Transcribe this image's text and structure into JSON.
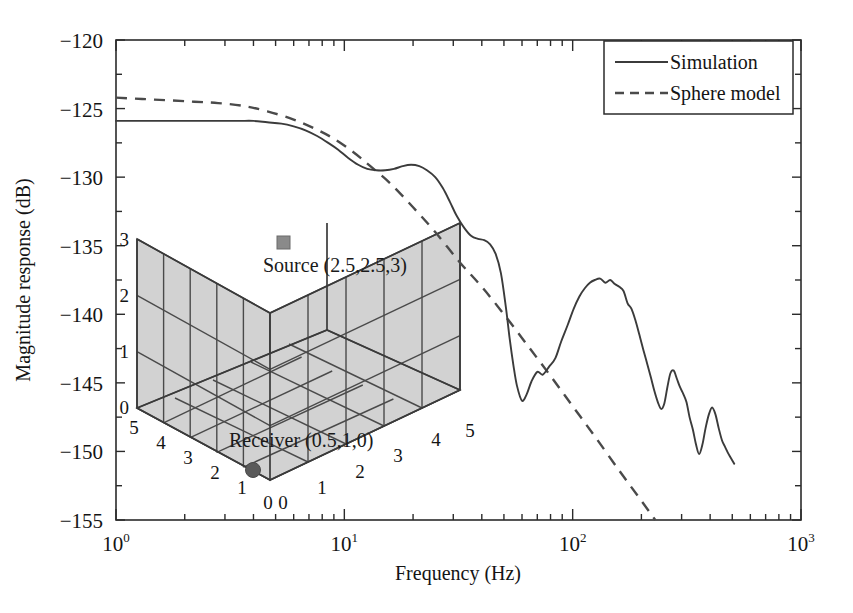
{
  "chart_data": {
    "type": "line",
    "title": "",
    "xlabel": "Frequency (Hz)",
    "ylabel": "Magnitude response (dB)",
    "xscale": "log",
    "xlim": [
      1,
      1000
    ],
    "ylim": [
      -155,
      -120
    ],
    "grid": false,
    "legend_position": "top-right",
    "xticks": [
      {
        "value": 1,
        "mantissa": "10",
        "exponent": "0"
      },
      {
        "value": 10,
        "mantissa": "10",
        "exponent": "1"
      },
      {
        "value": 100,
        "mantissa": "10",
        "exponent": "2"
      },
      {
        "value": 1000,
        "mantissa": "10",
        "exponent": "3"
      }
    ],
    "yticks": [
      {
        "value": -120,
        "label": "−120"
      },
      {
        "value": -125,
        "label": "−125"
      },
      {
        "value": -130,
        "label": "−130"
      },
      {
        "value": -135,
        "label": "−135"
      },
      {
        "value": -140,
        "label": "−140"
      },
      {
        "value": -145,
        "label": "−145"
      },
      {
        "value": -150,
        "label": "−150"
      },
      {
        "value": -155,
        "label": "−155"
      }
    ],
    "series": [
      {
        "name": "Simulation",
        "style": "solid",
        "color": "#3b3b3b",
        "x": [
          1.0,
          1.15,
          1.35,
          1.6,
          1.9,
          2.2,
          2.6,
          3.0,
          3.5,
          4.0,
          4.6,
          5.3,
          6.0,
          6.8,
          7.6,
          8.5,
          9.4,
          10.4,
          11.5,
          12.6,
          13.8,
          15.1,
          16.5,
          18.0,
          19.6,
          21.3,
          23.0,
          25.0,
          27.0,
          29.0,
          31.0,
          33.5,
          36.0,
          38.5,
          41.0,
          43.5,
          46.0,
          48.5,
          51.0,
          53.0,
          55.0,
          57.0,
          60.0,
          63.0,
          66.0,
          70.0,
          74.0,
          79.0,
          84.0,
          89.0,
          95.0,
          101.0,
          107.0,
          113.0,
          119.0,
          125.0,
          132.0,
          139.0,
          146.0,
          153.0,
          160.0,
          167.0,
          174.0,
          181.0,
          188.0,
          196.0,
          204.0,
          212.0,
          220.0,
          228.0,
          236.0,
          244.0,
          252.0,
          260.0,
          268.0,
          277.0,
          286.0,
          295.0,
          305.0,
          315.0,
          325.0,
          336.0,
          347.0,
          358.0,
          370.0,
          382.0,
          395.0,
          408.0,
          422.0,
          436.0,
          451.0,
          466.0,
          482.0,
          498.0,
          510.0
        ],
        "y": [
          -125.9,
          -125.9,
          -125.9,
          -125.9,
          -125.9,
          -125.9,
          -125.9,
          -125.9,
          -125.9,
          -125.9,
          -126.0,
          -126.1,
          -126.3,
          -126.6,
          -127.0,
          -127.5,
          -128.0,
          -128.6,
          -129.1,
          -129.4,
          -129.5,
          -129.5,
          -129.4,
          -129.2,
          -129.1,
          -129.2,
          -129.5,
          -130.0,
          -130.8,
          -131.8,
          -132.8,
          -133.7,
          -134.3,
          -134.5,
          -134.6,
          -134.9,
          -135.6,
          -137.0,
          -139.5,
          -141.8,
          -143.7,
          -145.2,
          -146.3,
          -145.8,
          -144.9,
          -144.2,
          -144.4,
          -143.8,
          -143.2,
          -142.0,
          -140.8,
          -139.6,
          -138.7,
          -138.1,
          -137.7,
          -137.5,
          -137.4,
          -137.7,
          -137.5,
          -137.8,
          -138.0,
          -138.3,
          -139.2,
          -139.6,
          -140.4,
          -141.5,
          -142.6,
          -143.6,
          -144.6,
          -145.6,
          -146.4,
          -146.9,
          -146.5,
          -145.3,
          -144.3,
          -144.1,
          -144.7,
          -145.3,
          -145.8,
          -146.4,
          -147.5,
          -148.4,
          -149.5,
          -150.2,
          -149.5,
          -148.3,
          -147.3,
          -146.8,
          -147.3,
          -148.3,
          -149.2,
          -149.7,
          -150.2,
          -150.6,
          -150.9
        ]
      },
      {
        "name": "Sphere model",
        "style": "dashed",
        "color": "#4a4a4a",
        "x": [
          1.0,
          1.3,
          1.7,
          2.2,
          2.8,
          3.6,
          4.6,
          6.0,
          7.5,
          9.0,
          11.0,
          13.0,
          16.0,
          20.0,
          25.0,
          32.0,
          40.0,
          50.0,
          63.0,
          80.0,
          100.0,
          125.0,
          160.0,
          200.0,
          230.0
        ],
        "y": [
          -124.2,
          -124.3,
          -124.4,
          -124.5,
          -124.6,
          -124.8,
          -125.2,
          -125.8,
          -126.5,
          -127.2,
          -128.2,
          -129.2,
          -130.5,
          -132.2,
          -134.0,
          -136.2,
          -138.0,
          -140.0,
          -142.2,
          -144.5,
          -146.7,
          -148.9,
          -151.4,
          -153.6,
          -155.0
        ]
      }
    ]
  },
  "legend": {
    "items": [
      {
        "label": "Simulation",
        "style": "solid"
      },
      {
        "label": "Sphere model",
        "style": "dashed"
      }
    ]
  },
  "inset": {
    "type": "3d-room-geometry",
    "source": {
      "label": "Source (2.5,2.5,3)",
      "coords": [
        2.5,
        2.5,
        3
      ],
      "marker": "square"
    },
    "receiver": {
      "label": "Receiver (0.5,1,0)",
      "coords": [
        0.5,
        1,
        0
      ],
      "marker": "circle"
    },
    "axes": {
      "x_ticks": [
        "0",
        "1",
        "2",
        "3",
        "4",
        "5"
      ],
      "y_ticks": [
        "5",
        "4",
        "3",
        "2",
        "1",
        "0"
      ],
      "z_ticks": [
        "0",
        "1",
        "2",
        "3"
      ]
    },
    "room_dimensions": [
      5,
      5,
      3
    ],
    "fill_color": "#d2d2d2",
    "grid_color": "#4a4a4a"
  }
}
